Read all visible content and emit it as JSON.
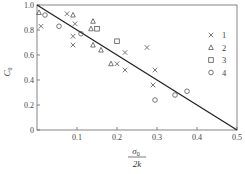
{
  "chart_data": {
    "type": "scatter",
    "title": "",
    "xlabel": "σ0 / 2k",
    "ylabel": "C0",
    "xlim": [
      0,
      0.5
    ],
    "ylim": [
      0,
      1.0
    ],
    "x_ticks": [
      "0.1",
      "0.2",
      "0.3",
      "0.4",
      "0.5"
    ],
    "y_ticks": [
      "0",
      "0.2",
      "0.4",
      "0.6",
      "0.8",
      "1.0"
    ],
    "grid": false,
    "legend_position": "right",
    "trend_line": {
      "from": [
        0,
        1.0
      ],
      "to": [
        0.5,
        0
      ]
    },
    "series": [
      {
        "name": "1",
        "marker": "x",
        "points": [
          [
            0.01,
            0.83
          ],
          [
            0.075,
            0.93
          ],
          [
            0.095,
            0.85
          ],
          [
            0.09,
            0.75
          ],
          [
            0.09,
            0.68
          ],
          [
            0.2,
            0.53
          ],
          [
            0.22,
            0.62
          ],
          [
            0.22,
            0.48
          ],
          [
            0.275,
            0.66
          ],
          [
            0.29,
            0.36
          ],
          [
            0.295,
            0.48
          ]
        ]
      },
      {
        "name": "2",
        "marker": "triangle",
        "points": [
          [
            0.005,
            0.94
          ],
          [
            0.09,
            0.92
          ],
          [
            0.14,
            0.87
          ],
          [
            0.135,
            0.81
          ],
          [
            0.14,
            0.68
          ],
          [
            0.16,
            0.64
          ],
          [
            0.185,
            0.53
          ]
        ]
      },
      {
        "name": "3",
        "marker": "square",
        "points": [
          [
            0.15,
            0.81
          ],
          [
            0.2,
            0.71
          ]
        ]
      },
      {
        "name": "4",
        "marker": "circle",
        "points": [
          [
            0.02,
            0.92
          ],
          [
            0.055,
            0.83
          ],
          [
            0.11,
            0.77
          ],
          [
            0.295,
            0.24
          ],
          [
            0.345,
            0.28
          ],
          [
            0.375,
            0.31
          ]
        ]
      }
    ]
  },
  "axis": {
    "y_label_main": "C",
    "y_label_sub": "0",
    "x_label_num": "σ",
    "x_label_num_sub": "0",
    "x_label_den": "2k",
    "zero_label": "0"
  },
  "legend": [
    "1",
    "2",
    "3",
    "4"
  ]
}
